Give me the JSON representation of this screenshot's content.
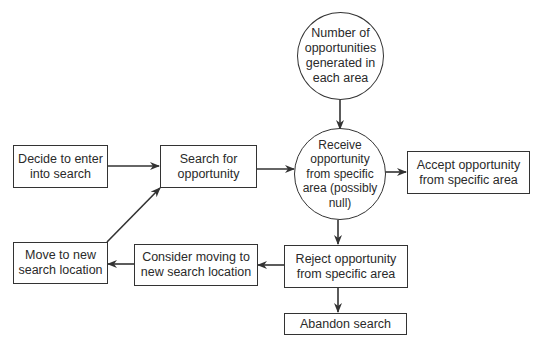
{
  "diagram": {
    "type": "flowchart",
    "nodes": [
      {
        "id": "generated",
        "shape": "circle",
        "label": "Number of\nopportunities\ngenerated in\neach area"
      },
      {
        "id": "decide",
        "shape": "rect",
        "label": "Decide to enter\ninto search"
      },
      {
        "id": "search",
        "shape": "rect",
        "label": "Search for\nopportunity"
      },
      {
        "id": "receive",
        "shape": "circle",
        "label": "Receive\nopportunity\nfrom specific\narea (possibly\nnull)"
      },
      {
        "id": "accept",
        "shape": "rect",
        "label": "Accept opportunity\nfrom specific area"
      },
      {
        "id": "move",
        "shape": "rect",
        "label": "Move to new\nsearch location"
      },
      {
        "id": "consider",
        "shape": "rect",
        "label": "Consider moving to\nnew search location"
      },
      {
        "id": "reject",
        "shape": "rect",
        "label": "Reject opportunity\nfrom specific area"
      },
      {
        "id": "abandon",
        "shape": "rect",
        "label": "Abandon search"
      }
    ],
    "edges": [
      {
        "from": "generated",
        "to": "receive"
      },
      {
        "from": "decide",
        "to": "search"
      },
      {
        "from": "search",
        "to": "receive"
      },
      {
        "from": "receive",
        "to": "accept"
      },
      {
        "from": "receive",
        "to": "reject"
      },
      {
        "from": "reject",
        "to": "consider"
      },
      {
        "from": "reject",
        "to": "abandon"
      },
      {
        "from": "consider",
        "to": "move"
      },
      {
        "from": "move",
        "to": "search"
      }
    ],
    "colors": {
      "stroke": "#333333",
      "background": "#ffffff",
      "text": "#2a2a2a"
    }
  }
}
